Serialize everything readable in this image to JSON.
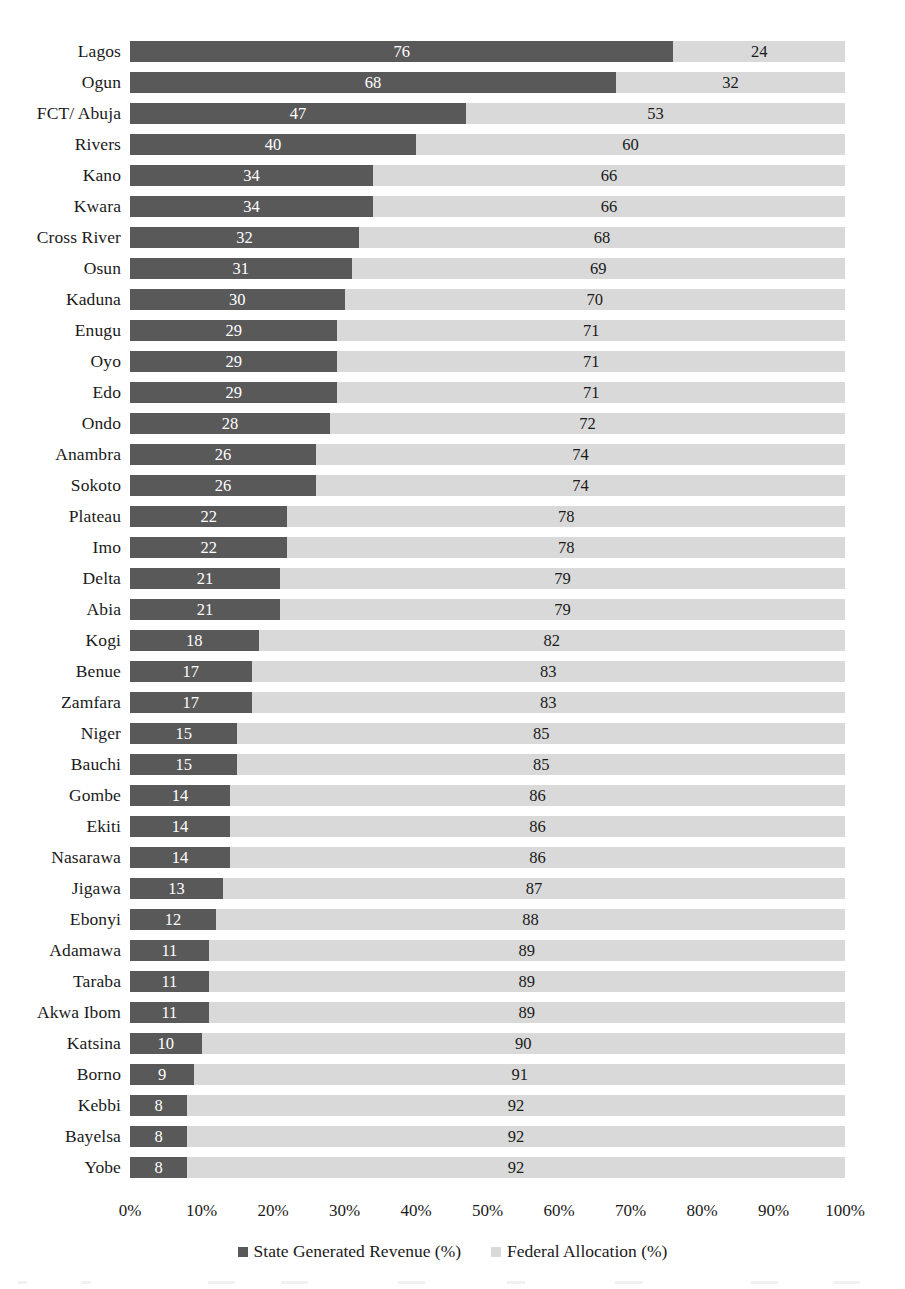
{
  "chart_data": {
    "type": "bar",
    "orientation": "horizontal",
    "stacked": true,
    "normalized": "100% stacked",
    "title": "",
    "subtitle": "",
    "xlabel": "",
    "ylabel": "",
    "xlim": [
      0,
      100
    ],
    "grid": false,
    "legend_position": "bottom-center",
    "categories": [
      "Lagos",
      "Ogun",
      "FCT/ Abuja",
      "Rivers",
      "Kano",
      "Kwara",
      "Cross River",
      "Osun",
      "Kaduna",
      "Enugu",
      "Oyo",
      "Edo",
      "Ondo",
      "Anambra",
      "Sokoto",
      "Plateau",
      "Imo",
      "Delta",
      "Abia",
      "Kogi",
      "Benue",
      "Zamfara",
      "Niger",
      "Bauchi",
      "Gombe",
      "Ekiti",
      "Nasarawa",
      "Jigawa",
      "Ebonyi",
      "Adamawa",
      "Taraba",
      "Akwa Ibom",
      "Katsina",
      "Borno",
      "Kebbi",
      "Bayelsa",
      "Yobe"
    ],
    "series": [
      {
        "name": "State Generated Revenue (%)",
        "color": "#595959",
        "values": [
          76,
          68,
          47,
          40,
          34,
          34,
          32,
          31,
          30,
          29,
          29,
          29,
          28,
          26,
          26,
          22,
          22,
          21,
          21,
          18,
          17,
          17,
          15,
          15,
          14,
          14,
          14,
          13,
          12,
          11,
          11,
          11,
          10,
          9,
          8,
          8,
          8
        ]
      },
      {
        "name": "Federal Allocation (%)",
        "color": "#d9d9d9",
        "values": [
          24,
          32,
          53,
          60,
          66,
          66,
          68,
          69,
          70,
          71,
          71,
          71,
          72,
          74,
          74,
          78,
          78,
          79,
          79,
          82,
          83,
          83,
          85,
          85,
          86,
          86,
          86,
          87,
          88,
          89,
          89,
          89,
          90,
          91,
          92,
          92,
          92
        ]
      }
    ],
    "x_ticks": [
      "0%",
      "10%",
      "20%",
      "30%",
      "40%",
      "50%",
      "60%",
      "70%",
      "80%",
      "90%",
      "100%"
    ],
    "x_tick_values": [
      0,
      10,
      20,
      30,
      40,
      50,
      60,
      70,
      80,
      90,
      100
    ]
  },
  "legend": {
    "items": [
      {
        "label": "State Generated Revenue (%)",
        "color": "#595959"
      },
      {
        "label": "Federal Allocation (%)",
        "color": "#d9d9d9"
      }
    ]
  },
  "colors": {
    "series_a": "#595959",
    "series_b": "#d9d9d9",
    "text": "#1a1a1a",
    "background": "#ffffff"
  }
}
